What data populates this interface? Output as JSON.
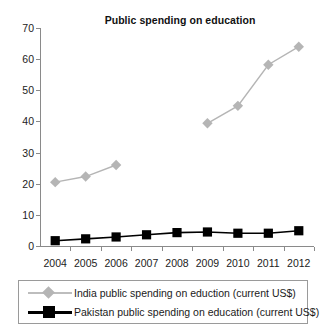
{
  "chart_data": {
    "type": "line",
    "title": "Public spending on education",
    "xlabel": "",
    "ylabel": "",
    "x": [
      "2004",
      "2005",
      "2006",
      "2007",
      "2008",
      "2009",
      "2010",
      "2011",
      "2012"
    ],
    "categories": [
      "2004",
      "2005",
      "2006",
      "2007",
      "2008",
      "2009",
      "2010",
      "2011",
      "2012"
    ],
    "ylim": [
      0,
      70
    ],
    "yticks": [
      0,
      10,
      20,
      30,
      40,
      50,
      60,
      70
    ],
    "ytick_labels": [
      "0",
      "10",
      "20",
      "30",
      "40",
      "50",
      "60",
      "70"
    ],
    "grid": false,
    "legend_position": "bottom",
    "series": [
      {
        "name": "India public spending on eduction (current US$)",
        "color": "#b5b5b5",
        "marker": "diamond",
        "values": [
          20.5,
          22.3,
          26.0,
          null,
          null,
          39.4,
          45.0,
          58.2,
          64.0
        ]
      },
      {
        "name": "Pakistan public spending on education (current US$)",
        "color": "#000000",
        "marker": "square",
        "values": [
          1.7,
          2.3,
          2.9,
          3.6,
          4.3,
          4.5,
          4.1,
          4.1,
          4.9
        ]
      }
    ]
  },
  "legend": {
    "items": [
      {
        "label": "India public spending on eduction (current US$)",
        "marker": "diamond-marker-icon"
      },
      {
        "label": "Pakistan public spending on education (current US$)",
        "marker": "square-marker-icon"
      }
    ]
  },
  "colors": {
    "india": "#b5b5b5",
    "pakistan": "#000000",
    "axis": "#8a8a8a",
    "text": "#1a1a1a",
    "background": "#ffffff"
  }
}
